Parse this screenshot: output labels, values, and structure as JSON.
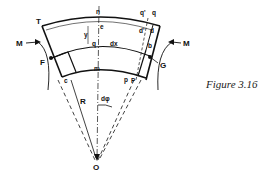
{
  "figure": {
    "caption": "Figure 3.16",
    "labels": {
      "T": "T",
      "n": "n",
      "q_prime": "q'",
      "q_top": "q",
      "e": "e",
      "d_prime": "d'",
      "d": "d",
      "y": "y",
      "q_mid": "q",
      "dx": "dx",
      "b": "b",
      "M_left": "M",
      "M_right": "M",
      "F": "F",
      "G": "G",
      "c": "c",
      "m": "m",
      "p": "p",
      "P": "P",
      "R": "R",
      "dphi": "dφ",
      "O": "O"
    },
    "colors": {
      "line": "#111111",
      "background": "#ffffff"
    }
  }
}
